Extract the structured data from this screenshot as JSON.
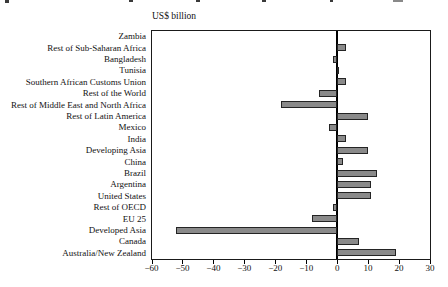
{
  "figure": {
    "axis_unit_title": "US$ billion"
  },
  "chart_data": {
    "type": "bar",
    "orientation": "horizontal",
    "title": "US$ billion",
    "xlabel": "US$ billion",
    "ylabel": "",
    "xlim": [
      -60,
      35
    ],
    "xticks": [
      -60,
      -50,
      -40,
      -30,
      -20,
      -10,
      0,
      10,
      20,
      30
    ],
    "xtick_labels": [
      "−60",
      "−50",
      "−40",
      "−30",
      "−20",
      "−10",
      "0",
      "10",
      "20",
      "30"
    ],
    "grid": false,
    "legend_position": "none",
    "bar_color": "#8a8a8a",
    "bar_border_color": "#242424",
    "categories": [
      "Zambia",
      "Rest of Sub-Saharan Africa",
      "Bangladesh",
      "Tunisia",
      "Southern African Customs Union",
      "Rest of the World",
      "Rest of Middle East and North Africa",
      "Rest of Latin America",
      "Mexico",
      "India",
      "Developing Asia",
      "China",
      "Brazil",
      "Argentina",
      "United States",
      "Rest of OECD",
      "EU 25",
      "Developed Asia",
      "Canada",
      "Australia/New Zealand"
    ],
    "values": [
      0,
      3,
      -1.5,
      0.5,
      3,
      -6,
      -18,
      10,
      -2.5,
      3,
      10,
      2,
      13,
      11,
      11,
      -1.5,
      -8,
      -52,
      7,
      19
    ]
  }
}
